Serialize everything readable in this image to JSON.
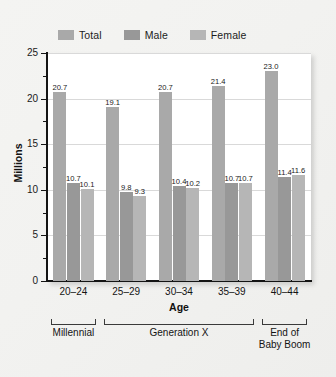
{
  "chart_data": {
    "type": "bar",
    "title": "",
    "xlabel": "Age",
    "ylabel": "Millions",
    "ylim": [
      0,
      25
    ],
    "yticks": [
      0,
      5,
      10,
      15,
      20,
      25
    ],
    "ytick_labels": [
      "0",
      "5",
      "10",
      "15",
      "20",
      "25"
    ],
    "minor_yticks": [
      2.5,
      7.5,
      12.5,
      17.5,
      22.5
    ],
    "grid": "horizontal-major",
    "legend_position": "top-left",
    "categories": [
      "20–24",
      "25–29",
      "30–34",
      "35–39",
      "40–44"
    ],
    "series": [
      {
        "name": "Total",
        "color": "#a9a9a9",
        "values": [
          20.7,
          19.1,
          20.7,
          21.4,
          23.0
        ],
        "labels": [
          "20.7",
          "19.1",
          "20.7",
          "21.4",
          "23.0"
        ]
      },
      {
        "name": "Male",
        "color": "#989898",
        "values": [
          10.7,
          9.8,
          10.4,
          10.7,
          11.4
        ],
        "labels": [
          "10.7",
          "9.8",
          "10.4",
          "10.7",
          "11.4"
        ]
      },
      {
        "name": "Female",
        "color": "#b6b6b6",
        "values": [
          10.1,
          9.3,
          10.2,
          10.7,
          11.6
        ],
        "labels": [
          "10.1",
          "9.3",
          "10.2",
          "10.7",
          "11.6"
        ]
      }
    ],
    "annotations": [
      {
        "label": "Millennial",
        "spans": [
          "20–24"
        ]
      },
      {
        "label": "Generation X",
        "spans": [
          "25–29",
          "30–34",
          "35–39"
        ]
      },
      {
        "label": "End of\nBaby Boom",
        "spans": [
          "40–44"
        ]
      }
    ]
  },
  "legend": {
    "items": [
      {
        "label": "Total",
        "color": "#a9a9a9"
      },
      {
        "label": "Male",
        "color": "#989898"
      },
      {
        "label": "Female",
        "color": "#b6b6b6"
      }
    ]
  },
  "axes": {
    "y_title": "Millions",
    "x_title": "Age",
    "y_labels": [
      "25",
      "20",
      "15",
      "10",
      "5",
      "0"
    ],
    "x_labels": [
      "20–24",
      "25–29",
      "30–34",
      "35–39",
      "40–44"
    ]
  },
  "brackets": [
    {
      "label": "Millennial",
      "line1": "Millennial",
      "line2": ""
    },
    {
      "label": "Generation X",
      "line1": "Generation X",
      "line2": ""
    },
    {
      "label": "End of Baby Boom",
      "line1": "End of",
      "line2": "Baby Boom"
    }
  ],
  "colors": {
    "total": "#a9a9a9",
    "male": "#989898",
    "female": "#b6b6b6",
    "axis": "#141414",
    "grid": "#d9d9d9",
    "plot_bg": "#ffffff",
    "page_bg": "#f2f2f0"
  }
}
